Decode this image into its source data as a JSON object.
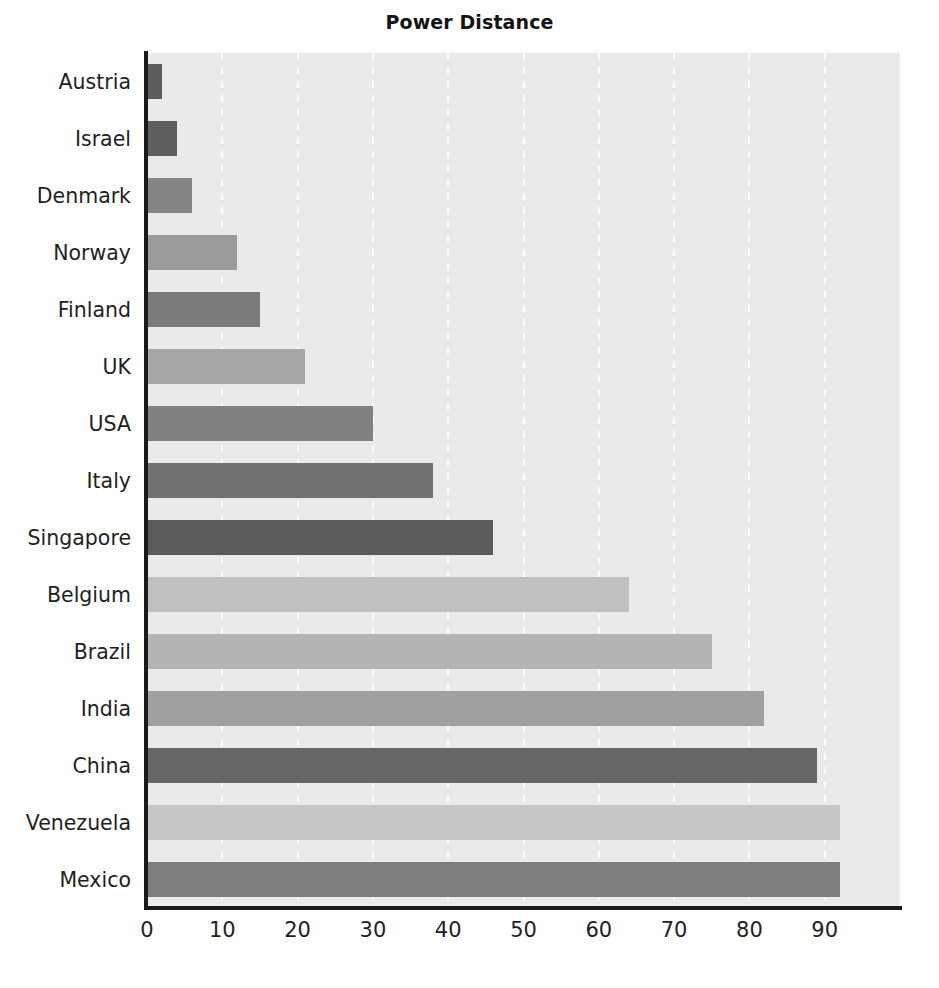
{
  "chart_data": {
    "type": "bar",
    "orientation": "horizontal",
    "title": "Power Distance",
    "xlabel": "",
    "ylabel": "",
    "xlim": [
      0,
      100
    ],
    "xticks": [
      0,
      10,
      20,
      30,
      40,
      50,
      60,
      70,
      80,
      90
    ],
    "xtick_labels": [
      "0",
      "10",
      "20",
      "30",
      "40",
      "50",
      "60",
      "70",
      "80",
      "90"
    ],
    "grid": "vertical-dashed-white",
    "legend": "none",
    "plot_background": "#eaeaea",
    "categories": [
      "Austria",
      "Israel",
      "Denmark",
      "Norway",
      "Finland",
      "UK",
      "USA",
      "Italy",
      "Singapore",
      "Belgium",
      "Brazil",
      "India",
      "China",
      "Venezuela",
      "Mexico"
    ],
    "values": [
      2,
      4,
      6,
      12,
      15,
      21,
      30,
      38,
      46,
      64,
      75,
      82,
      89,
      92,
      92
    ],
    "bar_colors": [
      "#5c5c5c",
      "#5e5e5e",
      "#858585",
      "#9b9b9b",
      "#7a7a7a",
      "#a6a6a6",
      "#818181",
      "#717171",
      "#5b5b5b",
      "#c0c0c0",
      "#b4b4b4",
      "#a0a0a0",
      "#666666",
      "#c6c6c6",
      "#7d7d7d"
    ],
    "bars": [
      {
        "category": "Austria",
        "value": 2,
        "color": "#5c5c5c"
      },
      {
        "category": "Israel",
        "value": 4,
        "color": "#5e5e5e"
      },
      {
        "category": "Denmark",
        "value": 6,
        "color": "#858585"
      },
      {
        "category": "Norway",
        "value": 12,
        "color": "#9b9b9b"
      },
      {
        "category": "Finland",
        "value": 15,
        "color": "#7a7a7a"
      },
      {
        "category": "UK",
        "value": 21,
        "color": "#a6a6a6"
      },
      {
        "category": "USA",
        "value": 30,
        "color": "#818181"
      },
      {
        "category": "Italy",
        "value": 38,
        "color": "#717171"
      },
      {
        "category": "Singapore",
        "value": 46,
        "color": "#5b5b5b"
      },
      {
        "category": "Belgium",
        "value": 64,
        "color": "#c0c0c0"
      },
      {
        "category": "Brazil",
        "value": 75,
        "color": "#b4b4b4"
      },
      {
        "category": "India",
        "value": 82,
        "color": "#a0a0a0"
      },
      {
        "category": "China",
        "value": 89,
        "color": "#666666"
      },
      {
        "category": "Venezuela",
        "value": 92,
        "color": "#c6c6c6"
      },
      {
        "category": "Mexico",
        "value": 92,
        "color": "#7d7d7d"
      }
    ]
  },
  "axis": {
    "line_color": "#1a1a1a"
  }
}
